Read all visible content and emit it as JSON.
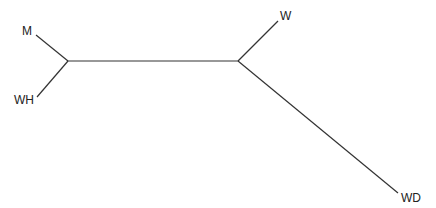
{
  "diagram": {
    "type": "unrooted-tree",
    "nodes": {
      "internal_left": {
        "x": 68,
        "y": 61
      },
      "internal_right": {
        "x": 238,
        "y": 61
      }
    },
    "leaves": [
      {
        "id": "M",
        "label": "M",
        "tip": {
          "x": 36,
          "y": 35
        },
        "label_pos": {
          "x": 22,
          "y": 35
        }
      },
      {
        "id": "WH",
        "label": "WH",
        "tip": {
          "x": 37,
          "y": 97
        },
        "label_pos": {
          "x": 14,
          "y": 104
        }
      },
      {
        "id": "W",
        "label": "W",
        "tip": {
          "x": 278,
          "y": 21
        },
        "label_pos": {
          "x": 280,
          "y": 20
        }
      },
      {
        "id": "WD",
        "label": "WD",
        "tip": {
          "x": 398,
          "y": 193
        },
        "label_pos": {
          "x": 401,
          "y": 202
        }
      }
    ],
    "edges": [
      {
        "from": "internal_left",
        "to": "M"
      },
      {
        "from": "internal_left",
        "to": "WH"
      },
      {
        "from": "internal_left",
        "to": "internal_right"
      },
      {
        "from": "internal_right",
        "to": "W"
      },
      {
        "from": "internal_right",
        "to": "WD"
      }
    ]
  }
}
